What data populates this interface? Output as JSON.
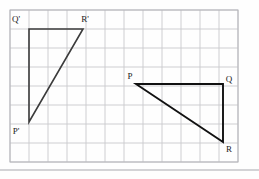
{
  "figure": {
    "background_color": "#fefefe",
    "grid": {
      "line_color": "#c9c9cd",
      "border_color": "#b4b4ba",
      "origin_x": 10,
      "origin_y": 10,
      "cell_size": 19,
      "cols": 12,
      "rows": 8,
      "visible": true
    },
    "divider_rule": {
      "name": "page-divider",
      "color": "#a8a8ae",
      "y": 170,
      "x_start": 0,
      "x_end": 259,
      "thickness": 1
    },
    "shapes": [
      {
        "name": "triangle-image-prime",
        "label": "P'Q'R'",
        "stroke": "#3c3c3c",
        "stroke_width": 1.6,
        "fill": "none",
        "vertices": [
          {
            "name": "Q-prime",
            "label": "Q'",
            "x": 29,
            "y": 29,
            "label_x": 16,
            "label_y": 22
          },
          {
            "name": "R-prime",
            "label": "R'",
            "x": 83,
            "y": 29,
            "label_x": 85,
            "label_y": 22
          },
          {
            "name": "P-prime",
            "label": "P'",
            "x": 29,
            "y": 122,
            "label_x": 16,
            "label_y": 134
          }
        ],
        "path": "M 29 29 L 83 29 L 29 122 Z"
      },
      {
        "name": "triangle-preimage",
        "label": "PQR",
        "stroke": "#111111",
        "stroke_width": 1.9,
        "fill": "none",
        "vertices": [
          {
            "name": "P",
            "label": "P",
            "x": 136,
            "y": 84,
            "label_x": 130,
            "label_y": 79
          },
          {
            "name": "Q",
            "label": "Q",
            "x": 223,
            "y": 84,
            "label_x": 229,
            "label_y": 82
          },
          {
            "name": "R",
            "label": "R",
            "x": 223,
            "y": 142,
            "label_x": 229,
            "label_y": 152
          }
        ],
        "path": "M 136 84 L 223 84 L 223 142 Z"
      }
    ]
  }
}
